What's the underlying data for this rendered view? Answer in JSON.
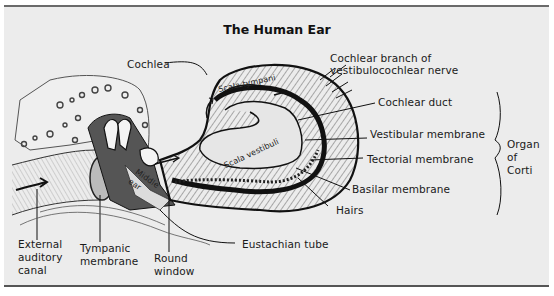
{
  "title": "The Human Ear",
  "labels": {
    "cochlea": "Cochlea",
    "cochlear_branch": "Cochlear branch of\nvestibulocochlear nerve",
    "cochlear_duct": "Cochlear duct",
    "vestibular_membrane": "Vestibular membrane",
    "tectorial_membrane": "Tectorial membrane",
    "basilar_membrane": "Basilar membrane",
    "hairs": "Hairs",
    "organ_of_corti": "Organ\nof\nCorti",
    "external_auditory_canal": "External\nauditory\ncanal",
    "tympanic_membrane": "Tympanic\nmembrane",
    "round_window": "Round\nwindow",
    "eustachian_tube": "Eustachian tube",
    "middle_ear": "Middle\near",
    "scala_tympani": "Scala tympani",
    "scala_vestibuli": "Scala vestibuli"
  },
  "colors": {
    "background": "#ececec",
    "ink": "#1a1a1a",
    "border": "#5a5a5a"
  }
}
